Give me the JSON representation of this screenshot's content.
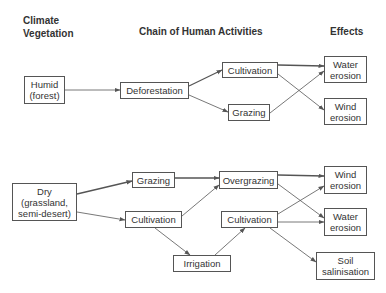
{
  "headers": {
    "climate_vegetation": "Climate\nVegetation",
    "chain": "Chain of Human Activities",
    "effects": "Effects"
  },
  "humid": {
    "climate": "Humid\n(forest)",
    "deforestation": "Deforestation",
    "cultivation": "Cultivation",
    "grazing": "Grazing",
    "water_erosion": "Water\nerosion",
    "wind_erosion": "Wind\nerosion"
  },
  "dry": {
    "climate": "Dry\n(grassland,\nsemi-desert)",
    "grazing": "Grazing",
    "cultivation": "Cultivation",
    "overgrazing": "Overgrazing",
    "cultivation_2": "Cultivation",
    "irrigation": "Irrigation",
    "wind_erosion": "Wind\nerosion",
    "water_erosion": "Water\nerosion",
    "soil_salinisation": "Soil\nsalinisation"
  },
  "edges": [
    {
      "from": "Humid (forest)",
      "to": "Deforestation"
    },
    {
      "from": "Deforestation",
      "to": "Cultivation"
    },
    {
      "from": "Deforestation",
      "to": "Grazing"
    },
    {
      "from": "Cultivation",
      "to": "Water erosion"
    },
    {
      "from": "Cultivation",
      "to": "Wind erosion"
    },
    {
      "from": "Grazing",
      "to": "Water erosion"
    },
    {
      "from": "Dry (grassland, semi-desert)",
      "to": "Grazing"
    },
    {
      "from": "Dry (grassland, semi-desert)",
      "to": "Cultivation"
    },
    {
      "from": "Grazing",
      "to": "Overgrazing"
    },
    {
      "from": "Cultivation",
      "to": "Overgrazing"
    },
    {
      "from": "Cultivation",
      "to": "Irrigation"
    },
    {
      "from": "Irrigation",
      "to": "Cultivation (2)"
    },
    {
      "from": "Overgrazing",
      "to": "Wind erosion"
    },
    {
      "from": "Overgrazing",
      "to": "Water erosion"
    },
    {
      "from": "Cultivation (2)",
      "to": "Wind erosion"
    },
    {
      "from": "Cultivation (2)",
      "to": "Water erosion"
    },
    {
      "from": "Cultivation (2)",
      "to": "Soil salinisation"
    }
  ],
  "colors": {
    "line": "#555555",
    "text": "#333333",
    "background": "#ffffff"
  }
}
